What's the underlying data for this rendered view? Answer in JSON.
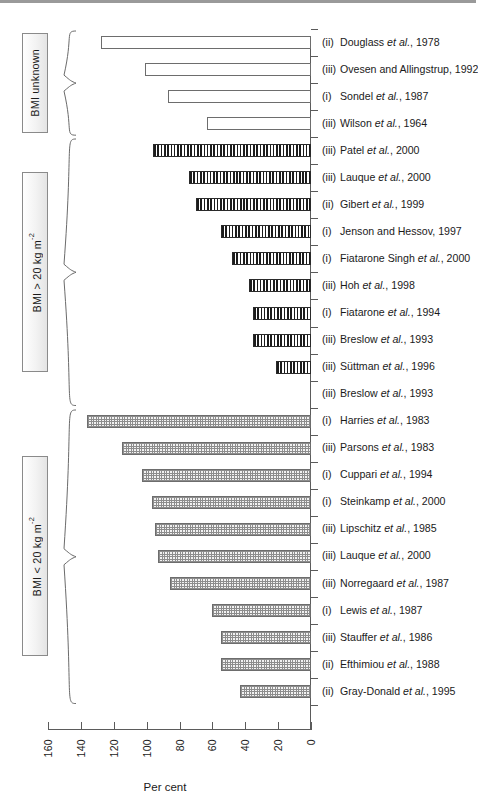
{
  "chart_data": {
    "type": "bar",
    "orientation": "horizontal",
    "title": "",
    "xlabel": "Per cent",
    "ylabel": "",
    "xlim": [
      0,
      160
    ],
    "x_tick_labels": [
      "160",
      "140",
      "120",
      "100",
      "80",
      "60",
      "40",
      "20",
      "0"
    ],
    "x_ticks": [
      160,
      140,
      120,
      100,
      80,
      60,
      40,
      20,
      0
    ],
    "x_axis_reversed": true,
    "grid": false,
    "legend": null,
    "groups": [
      {
        "label": "BMI unknown",
        "pattern": "open",
        "items": [
          {
            "numeral": "(ii)",
            "study": "Douglass et al., 1978",
            "value": 128
          },
          {
            "numeral": "(iii)",
            "study": "Ovesen and Allingstrup, 1992",
            "value": 101
          },
          {
            "numeral": "(i)",
            "study": "Sondel et al., 1987",
            "value": 87
          },
          {
            "numeral": "(iii)",
            "study": "Wilson et al., 1964",
            "value": 63
          }
        ]
      },
      {
        "label": "BMI > 20 kg m-2",
        "pattern": "striped",
        "items": [
          {
            "numeral": "(iii)",
            "study": "Patel et al., 2000",
            "value": 96
          },
          {
            "numeral": "(iii)",
            "study": "Lauque et al., 2000",
            "value": 74
          },
          {
            "numeral": "(ii)",
            "study": "Gibert et al., 1999",
            "value": 70
          },
          {
            "numeral": "(i)",
            "study": "Jenson and Hessov, 1997",
            "value": 55
          },
          {
            "numeral": "(i)",
            "study": "Fiatarone Singh et al., 2000",
            "value": 48
          },
          {
            "numeral": "(iii)",
            "study": "Hoh et al., 1998",
            "value": 38
          },
          {
            "numeral": "(i)",
            "study": "Fiatarone et al., 1994",
            "value": 35
          },
          {
            "numeral": "(iii)",
            "study": "Breslow et al., 1993",
            "value": 35
          },
          {
            "numeral": "(iii)",
            "study": "Suttman et al., 1996",
            "value": 21
          },
          {
            "numeral": "(iii)",
            "study": "Breslow et al., 1993",
            "value": 0
          }
        ]
      },
      {
        "label": "BMI < 20 kg m-2",
        "pattern": "dotted",
        "items": [
          {
            "numeral": "(i)",
            "study": "Harries et al., 1983",
            "value": 136
          },
          {
            "numeral": "(iii)",
            "study": "Parsons et al., 1983",
            "value": 115
          },
          {
            "numeral": "(i)",
            "study": "Cuppari et al., 1994",
            "value": 103
          },
          {
            "numeral": "(i)",
            "study": "Steinkamp et al., 2000",
            "value": 97
          },
          {
            "numeral": "(iii)",
            "study": "Lipschitz et al., 1985",
            "value": 95
          },
          {
            "numeral": "(iii)",
            "study": "Lauque et al., 2000",
            "value": 93
          },
          {
            "numeral": "(iii)",
            "study": "Norregaard et al., 1987",
            "value": 86
          },
          {
            "numeral": "(i)",
            "study": "Lewis et al., 1987",
            "value": 60
          },
          {
            "numeral": "(iii)",
            "study": "Stauffer et al., 1986",
            "value": 55
          },
          {
            "numeral": "(ii)",
            "study": "Efthimiou et al., 1988",
            "value": 55
          },
          {
            "numeral": "(ii)",
            "study": "Gray-Donald et al., 1995",
            "value": 43
          }
        ]
      }
    ]
  },
  "labels": {
    "group_unknown": "BMI unknown",
    "group_above": "BMI > 20 kg m",
    "group_above_sup": "-2",
    "group_below": "BMI < 20 kg m",
    "group_below_sup": "-2",
    "xaxis_title": "Per cent"
  }
}
